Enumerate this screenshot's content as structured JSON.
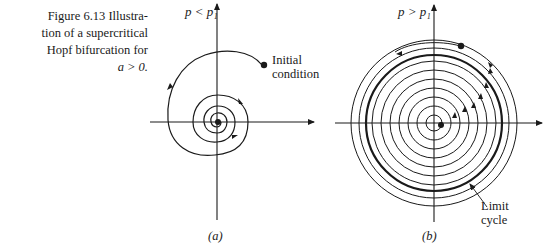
{
  "caption": {
    "figure_number": "Figure 6.13",
    "line1_rest": "Illustra-",
    "line2": "tion of a supercritical",
    "line3": "Hopf bifurcation for",
    "line4": "a > 0."
  },
  "panel_a": {
    "axis_label": "p < p₁",
    "annotation": [
      "Initial",
      "condition"
    ],
    "sublabel": "(a)"
  },
  "panel_b": {
    "axis_label": "p > p₁",
    "annotation": [
      "Limit",
      "cycle"
    ],
    "sublabel": "(b)"
  },
  "colors": {
    "ink": "#1a1a1a",
    "background": "#ffffff"
  }
}
